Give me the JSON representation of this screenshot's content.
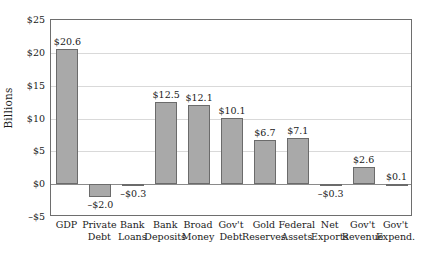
{
  "chart_data": {
    "type": "bar",
    "title": "",
    "subtitle": "",
    "xlabel": "",
    "ylabel": "Billions",
    "ylim": [
      -5,
      25
    ],
    "ytick_values": [
      25,
      20,
      15,
      10,
      5,
      0,
      -5
    ],
    "ytick_labels": [
      "$25",
      "$20",
      "$15",
      "$10",
      "$5",
      "$0",
      "-$5"
    ],
    "grid": true,
    "legend": "none",
    "bar_color": "#a9a9a9",
    "bar_border_color": "#6b6b6b",
    "gridline_color": "#d9d9d9",
    "axis_color": "#6e6e6e",
    "categories": [
      "GDP",
      "Private Debt",
      "Bank Loans",
      "Bank Deposits",
      "Broad Money",
      "Gov't Debt",
      "Gold Reserves",
      "Federal Assets",
      "Net Exports",
      "Gov't Revenue",
      "Gov't Expend."
    ],
    "values": [
      20.6,
      -2.0,
      -0.3,
      12.5,
      12.1,
      10.1,
      6.7,
      7.1,
      -0.3,
      2.6,
      0.1
    ],
    "data_labels": [
      "$20.6",
      "-$2.0",
      "-$0.3",
      "$12.5",
      "$12.1",
      "$10.1",
      "$6.7",
      "$7.1",
      "-$0.3",
      "$2.6",
      "$0.1"
    ]
  }
}
